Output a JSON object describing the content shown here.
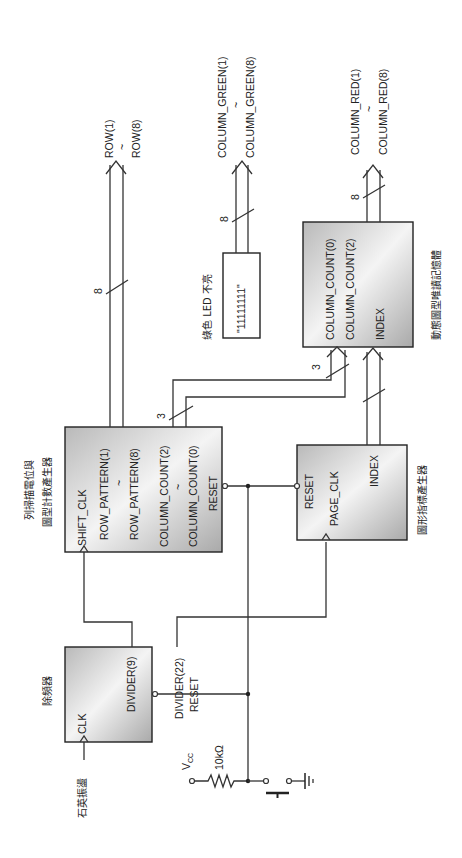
{
  "diagram": {
    "orientation": "rotated-90-ccw",
    "blocks": {
      "divider": {
        "title": "除頻器",
        "pins": {
          "clk": "CLK",
          "divider9": "DIVIDER(9)",
          "divider22": "DIVIDER(22)",
          "reset": "RESET"
        }
      },
      "row_scan": {
        "title_line1": "列掃描電位與",
        "title_line2": "圖型計數產生器",
        "pins": {
          "shift_clk": "SHIFT_CLK",
          "row_pattern_1": "ROW_PATTERN(1)",
          "row_tilde": "~",
          "row_pattern_8": "ROW_PATTERN(8)",
          "col_count_2": "COLUMN_COUNT(2)",
          "col_tilde": "~",
          "col_count_0": "COLUMN_COUNT(0)",
          "reset": "RESET"
        }
      },
      "pattern_index": {
        "title": "圖形指標產生器",
        "pins": {
          "reset": "RESET",
          "page_clk": "PAGE_CLK",
          "index": "INDEX"
        }
      },
      "pattern_memory": {
        "title": "動態圖型唯讀記憶體",
        "pins": {
          "col_count_0": "COLUMN_COUNT(0)",
          "col_count_2": "COLUMN_COUNT(2)",
          "index": "INDEX"
        }
      },
      "green_const": {
        "title": "綠色 LED 不亮",
        "value": "\"11111111\""
      }
    },
    "signals": {
      "oscillator": "石英振盪",
      "vcc": "V",
      "vcc_sub": "CC",
      "resistor": "10kΩ",
      "row_out_1": "ROW(1)",
      "row_out_tilde": "~",
      "row_out_8": "ROW(8)",
      "green_out_1": "COLUMN_GREEN(1)",
      "green_out_tilde": "~",
      "green_out_8": "COLUMN_GREEN(8)",
      "red_out_1": "COLUMN_RED(1)",
      "red_out_tilde": "~",
      "red_out_8": "COLUMN_RED(8)"
    },
    "bus_widths": {
      "row": "8",
      "green": "8",
      "red": "8",
      "col_count_src": "3",
      "col_count_dst": "3"
    }
  }
}
